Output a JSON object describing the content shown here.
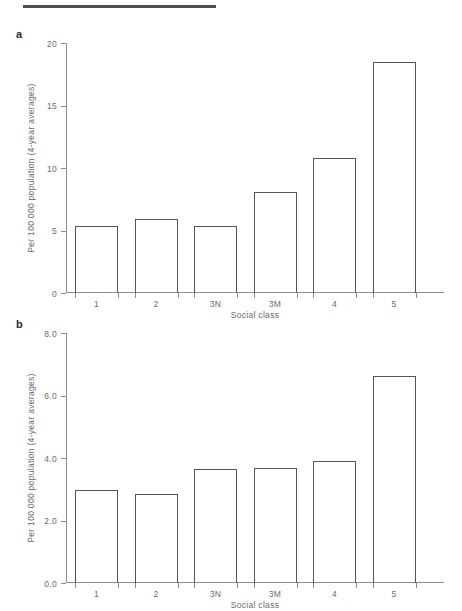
{
  "figure": {
    "rule_color": "#4d4d52",
    "axis_color": "#8d8d91",
    "bar_outline_color": "#555558",
    "text_color": "#6b6b70"
  },
  "panels": [
    {
      "label": "a",
      "ylabel": "Per 100 000 population (4-year averages)",
      "xlabel": "Social class",
      "yticks": [
        "0",
        "5",
        "10",
        "15",
        "20"
      ]
    },
    {
      "label": "b",
      "ylabel": "Per 100 000 population (4-year averages)",
      "xlabel": "Social class",
      "yticks": [
        "0.0",
        "2.0",
        "4.0",
        "6.0",
        "8.0"
      ]
    }
  ],
  "chart_data": [
    {
      "type": "bar",
      "panel": "a",
      "title": "",
      "categories": [
        "1",
        "2",
        "3N",
        "3M",
        "4",
        "5"
      ],
      "values": [
        5.4,
        5.9,
        5.35,
        8.1,
        10.8,
        18.5
      ],
      "xlabel": "Social class",
      "ylabel": "Per 100 000 population (4-year averages)",
      "ylim": [
        0,
        20
      ],
      "yticks": [
        0,
        5,
        10,
        15,
        20
      ],
      "ytick_labels": [
        "0",
        "5",
        "10",
        "15",
        "20"
      ],
      "grid": false,
      "legend": "none"
    },
    {
      "type": "bar",
      "panel": "b",
      "title": "",
      "categories": [
        "1",
        "2",
        "3N",
        "3M",
        "4",
        "5"
      ],
      "values": [
        2.97,
        2.85,
        3.65,
        3.68,
        3.9,
        6.62
      ],
      "xlabel": "Social class",
      "ylabel": "Per 100 000 population (4-year averages)",
      "ylim": [
        0,
        8
      ],
      "yticks": [
        0,
        2,
        4,
        6,
        8
      ],
      "ytick_labels": [
        "0.0",
        "2.0",
        "4.0",
        "6.0",
        "8.0"
      ],
      "grid": false,
      "legend": "none"
    }
  ]
}
